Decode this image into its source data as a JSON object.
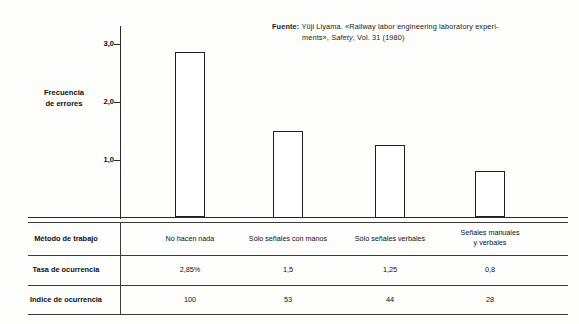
{
  "source": {
    "label": "Fuente:",
    "line1_a": " Yüji Liyama. «Railway labor engineering laboratory experi-",
    "line2_a": "ments», ",
    "line2_italic": "Safety",
    "line2_b": ", Vol. 31 (1980)"
  },
  "axis": {
    "title_line1": "Frecuencia",
    "title_line2": "de errores"
  },
  "table": {
    "row_labels": {
      "method": "Método de trabajo",
      "rate": "Tasa de ocurrencia",
      "index": "Indice de ocurrencia"
    }
  },
  "chart_data": {
    "type": "bar",
    "title": "",
    "xlabel": "Método de trabajo",
    "ylabel": "Frecuencia de errores",
    "ylim": [
      0,
      3.2
    ],
    "yticks": [
      1.0,
      2.0,
      3.0
    ],
    "ytick_labels": [
      "1,0",
      "2,0",
      "3,0"
    ],
    "grid": false,
    "legend": null,
    "categories": [
      "No hacen nada",
      "Sólo señales con manos",
      "Sólo señales verbales",
      "Señales manuales y verbales"
    ],
    "category_lines": [
      [
        "No hacen nada"
      ],
      [
        "Sólo señales con manos"
      ],
      [
        "Sólo señales verbales"
      ],
      [
        "Señales manuales",
        "y verbales"
      ]
    ],
    "values": [
      2.85,
      1.5,
      1.25,
      0.8
    ],
    "rate_labels": [
      "2,85%",
      "1,5",
      "1,25",
      "0,8"
    ],
    "index_values": [
      100,
      53,
      44,
      28
    ],
    "index_labels": [
      "100",
      "53",
      "44",
      "28"
    ],
    "bar_color": "#ffffff",
    "bar_edge_color": "#1f1f1f"
  }
}
